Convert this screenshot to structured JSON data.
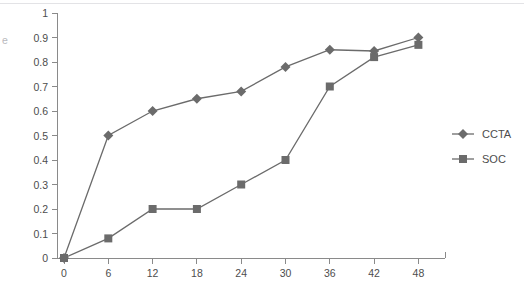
{
  "chart_data": {
    "type": "line",
    "title": "",
    "xlabel": "",
    "ylabel": "",
    "ylabel_partial_glyph": "e",
    "x": [
      0,
      6,
      12,
      18,
      24,
      30,
      36,
      42,
      48
    ],
    "xticks": [
      "0",
      "6",
      "12",
      "18",
      "24",
      "30",
      "36",
      "42",
      "48"
    ],
    "yticks": [
      "0",
      "0.1",
      "0.2",
      "0.3",
      "0.4",
      "0.5",
      "0.6",
      "0.7",
      "0.8",
      "0.9",
      "1"
    ],
    "xlim": [
      0,
      52
    ],
    "ylim": [
      0,
      1
    ],
    "grid": false,
    "legend_position": "right",
    "series": [
      {
        "name": "CCTA",
        "marker": "diamond",
        "color": "#6b6b6b",
        "values": [
          0.0,
          0.5,
          0.6,
          0.65,
          0.68,
          0.78,
          0.85,
          0.845,
          0.9
        ]
      },
      {
        "name": "SOC",
        "marker": "square",
        "color": "#6b6b6b",
        "values": [
          0.0,
          0.08,
          0.2,
          0.2,
          0.3,
          0.4,
          0.7,
          0.82,
          0.87
        ]
      }
    ]
  },
  "legend": {
    "items": [
      {
        "label": "CCTA",
        "marker": "diamond"
      },
      {
        "label": "SOC",
        "marker": "square"
      }
    ]
  }
}
